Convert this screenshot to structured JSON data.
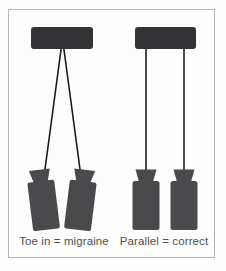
{
  "figure": {
    "background_color": "#fdfdfd",
    "frame_border_color": "#b8b8bc",
    "bar_color": "#333335",
    "pad_color": "#4a4a4d",
    "line_color": "#1a1a1a",
    "caption_color": "#4f4f53"
  },
  "panels": [
    {
      "id": "left-panel",
      "caption": "Toe in = migraine",
      "alignment": "toe-in",
      "handlebar": {
        "name": "handlebar",
        "x": 31,
        "y": 27,
        "width": 62,
        "height": 22,
        "corner_radius": 3
      },
      "extensions": [
        {
          "name": "extension-left",
          "x1": 61.5,
          "y1": 48,
          "x2": 44,
          "y2": 171
        },
        {
          "name": "extension-right",
          "x1": 63.5,
          "y1": 48,
          "x2": 80,
          "y2": 171
        }
      ],
      "armrests": [
        {
          "name": "armrest-left",
          "cx": 43,
          "cy": 200,
          "rotation": -7
        },
        {
          "name": "armrest-right",
          "cx": 81,
          "cy": 200,
          "rotation": 7
        }
      ]
    },
    {
      "id": "right-panel",
      "caption": "Parallel = correct",
      "alignment": "parallel",
      "handlebar": {
        "name": "handlebar",
        "x": 135,
        "y": 27,
        "width": 61,
        "height": 22,
        "corner_radius": 3
      },
      "extensions": [
        {
          "name": "extension-left",
          "x1": 146,
          "y1": 48,
          "x2": 146,
          "y2": 171
        },
        {
          "name": "extension-right",
          "x1": 184,
          "y1": 48,
          "x2": 184,
          "y2": 171
        }
      ],
      "armrests": [
        {
          "name": "armrest-left",
          "cx": 146,
          "cy": 200,
          "rotation": 0
        },
        {
          "name": "armrest-right",
          "cx": 184,
          "cy": 200,
          "rotation": 0
        }
      ]
    }
  ],
  "captions": {
    "left": "Toe in = migraine",
    "right": "Parallel = correct",
    "left_x": 64,
    "right_x": 164,
    "y": 245
  }
}
